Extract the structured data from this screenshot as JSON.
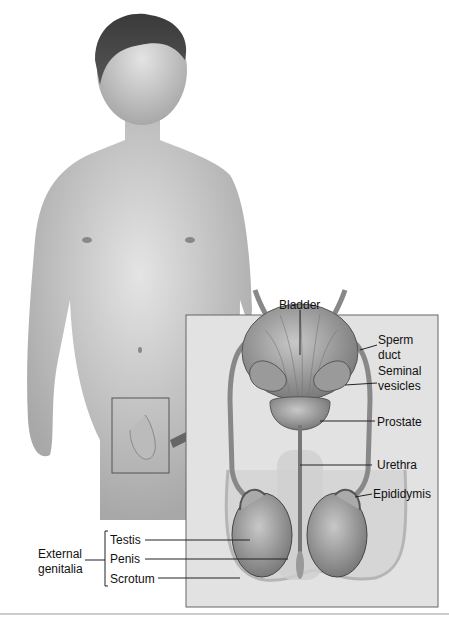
{
  "diagram": {
    "type": "anatomical-illustration",
    "labels": {
      "bladder": "Bladder",
      "sperm_duct": [
        "Sperm",
        "duct"
      ],
      "seminal_vesicles": [
        "Seminal",
        "vesicles"
      ],
      "prostate": "Prostate",
      "urethra": "Urethra",
      "epididymis": "Epididymis",
      "testis": "Testis",
      "penis": "Penis",
      "scrotum": "Scrotum",
      "external_genitalia": [
        "External",
        "genitalia"
      ]
    }
  }
}
